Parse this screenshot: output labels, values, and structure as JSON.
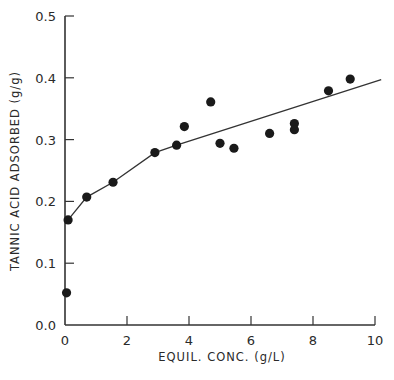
{
  "chart_data": {
    "type": "scatter",
    "title": "",
    "xlabel": "EQUIL. CONC. (g/L)",
    "ylabel": "TANNIC ACID ADSORBED (g/g)",
    "xlim": [
      0,
      10
    ],
    "ylim": [
      0.0,
      0.5
    ],
    "xticks": [
      0,
      2,
      4,
      6,
      8,
      10
    ],
    "xtick_labels": [
      "0",
      "2",
      "4",
      "6",
      "8",
      "10"
    ],
    "yticks": [
      0.0,
      0.1,
      0.2,
      0.3,
      0.4,
      0.5
    ],
    "ytick_labels": [
      "0.0",
      "0.1",
      "0.2",
      "0.3",
      "0.4",
      "0.5"
    ],
    "grid": false,
    "legend": null,
    "series": [
      {
        "name": "measured",
        "kind": "scatter",
        "marker": "filled-circle",
        "color": "#1a1a1a",
        "x": [
          0.05,
          0.1,
          0.7,
          1.55,
          2.9,
          3.6,
          3.85,
          4.7,
          5.0,
          5.45,
          6.6,
          7.4,
          7.4,
          8.5,
          9.2
        ],
        "y": [
          0.052,
          0.17,
          0.207,
          0.231,
          0.279,
          0.291,
          0.321,
          0.361,
          0.294,
          0.286,
          0.31,
          0.326,
          0.316,
          0.379,
          0.398
        ]
      },
      {
        "name": "fit",
        "kind": "line",
        "color": "#333333",
        "x": [
          0.1,
          0.7,
          1.55,
          2.9,
          3.6,
          10.2
        ],
        "y": [
          0.17,
          0.207,
          0.231,
          0.279,
          0.291,
          0.397
        ]
      }
    ]
  },
  "plot": {
    "left": 65,
    "right": 375,
    "top": 16,
    "bottom": 325,
    "axis_color": "#333333"
  }
}
